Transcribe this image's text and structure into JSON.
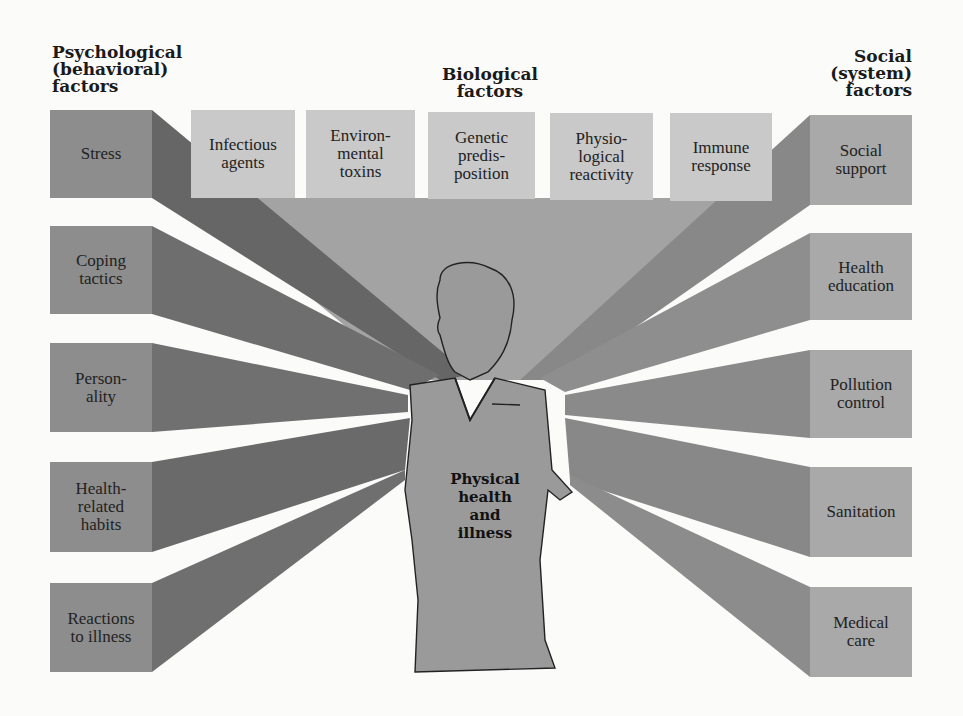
{
  "headings": {
    "psychological": "Psychological\n(behavioral)\nfactors",
    "biological": "Biological\nfactors",
    "social": "Social\n(system)\nfactors"
  },
  "psychological_factors": [
    {
      "label": "Stress"
    },
    {
      "label": "Coping\ntactics"
    },
    {
      "label": "Person-\nality"
    },
    {
      "label": "Health-\nrelated\nhabits"
    },
    {
      "label": "Reactions\nto illness"
    }
  ],
  "biological_factors": [
    {
      "label": "Infectious\nagents"
    },
    {
      "label": "Environ-\nmental\ntoxins"
    },
    {
      "label": "Genetic\npredis-\nposition"
    },
    {
      "label": "Physio-\nlogical\nreactivity"
    },
    {
      "label": "Immune\nresponse"
    }
  ],
  "social_factors": [
    {
      "label": "Social\nsupport"
    },
    {
      "label": "Health\neducation"
    },
    {
      "label": "Pollution\ncontrol"
    },
    {
      "label": "Sanitation"
    },
    {
      "label": "Medical\ncare"
    }
  ],
  "center": {
    "label": "Physical\nhealth\nand\nillness"
  },
  "colors": {
    "left_box": "#8d8d8d",
    "left_beam": "#6e6e6e",
    "top_box": "#c9c9c9",
    "top_beam": "#a3a3a3",
    "right_box": "#a9a9a9",
    "right_beam": "#8a8a8a",
    "figure": "#9a9a9a"
  }
}
